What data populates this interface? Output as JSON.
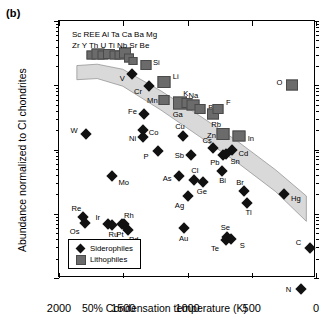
{
  "figure": {
    "panel_label": "(b)",
    "xtitle": "50% Condensation temperature (K)",
    "ytitle": "Abundance normalized to CI chondrites",
    "group_text_line1": "Sc REE Al Ta Ca Ba Mg",
    "group_text_line2": "Zr Y Th U Ti Nb Sr Be"
  },
  "legend": {
    "siderophiles_label": "Siderophiles",
    "lithophiles_label": "Lithophiles"
  },
  "colors": {
    "siderophile": "#111111",
    "lithophile": "#6b6b6b",
    "band": "#d9d9d9",
    "axis": "#000000"
  },
  "chart_data": {
    "type": "scatter",
    "title": "",
    "xlabel": "50% Condensation temperature (K)",
    "ylabel": "Abundance normalized to CI chondrites",
    "xlim": [
      2000,
      0
    ],
    "ylim": [
      0.001,
      10
    ],
    "xscale": "linear",
    "yscale": "log",
    "x_reversed": true,
    "xticks": [
      2000,
      1500,
      1000,
      500,
      0
    ],
    "xticklabels": [
      "2000",
      "1500",
      "1000",
      "500",
      "0"
    ],
    "yticks": [
      10,
      1,
      0.1,
      0.01,
      0.001
    ],
    "yticklabels": [
      "10",
      "1",
      "0.1",
      "0.01",
      "0.001"
    ],
    "grid": false,
    "legend_position": "lower left",
    "annotations": [
      {
        "text": "Sc REE Al Ta Ca Ba Mg",
        "x": 1830,
        "y": 6.2
      },
      {
        "text": "Zr Y Th U Ti Nb Sr Be",
        "x": 1830,
        "y": 4.9
      }
    ],
    "band": {
      "name": "refractory-to-volatile depletion trend band",
      "fill": "#d9d9d9",
      "upper": [
        [
          1860,
          2.0
        ],
        [
          1700,
          2.1
        ],
        [
          1500,
          1.75
        ],
        [
          1200,
          0.8
        ],
        [
          900,
          0.33
        ],
        [
          600,
          0.13
        ],
        [
          300,
          0.046
        ],
        [
          60,
          0.018
        ]
      ],
      "lower": [
        [
          1860,
          1.2
        ],
        [
          1700,
          1.25
        ],
        [
          1500,
          0.95
        ],
        [
          1200,
          0.4
        ],
        [
          900,
          0.155
        ],
        [
          600,
          0.06
        ],
        [
          300,
          0.021
        ],
        [
          60,
          0.0072
        ]
      ]
    },
    "series": [
      {
        "name": "Siderophiles",
        "marker": "diamond",
        "color": "#111111",
        "points": [
          {
            "label": "V",
            "x": 1430,
            "y": 1.5,
            "lx": -10,
            "ly": 4
          },
          {
            "label": "Cr",
            "x": 1300,
            "y": 0.98,
            "lx": -11,
            "ly": 5
          },
          {
            "label": "Fe",
            "x": 1335,
            "y": 0.36,
            "lx": -12,
            "ly": -3
          },
          {
            "label": "Ni",
            "x": 1350,
            "y": 0.2,
            "lx": -10,
            "ly": 8
          },
          {
            "label": "Co",
            "x": 1350,
            "y": 0.155,
            "lx": 11,
            "ly": -5
          },
          {
            "label": "W",
            "x": 1790,
            "y": 0.175,
            "lx": -12,
            "ly": -4
          },
          {
            "label": "Mo",
            "x": 1590,
            "y": 0.038,
            "lx": 12,
            "ly": 6
          },
          {
            "label": "Cu",
            "x": 1035,
            "y": 0.16,
            "lx": -3,
            "ly": -10
          },
          {
            "label": "P",
            "x": 1230,
            "y": 0.095,
            "lx": -12,
            "ly": 5
          },
          {
            "label": "Sb",
            "x": 970,
            "y": 0.082,
            "lx": -12,
            "ly": 0
          },
          {
            "label": "As",
            "x": 1065,
            "y": 0.038,
            "lx": -12,
            "ly": 2
          },
          {
            "label": "Cl",
            "x": 950,
            "y": 0.034,
            "lx": 1,
            "ly": -10
          },
          {
            "label": "Ge",
            "x": 880,
            "y": 0.031,
            "lx": -1,
            "ly": 9
          },
          {
            "label": "Ag",
            "x": 1000,
            "y": 0.019,
            "lx": -8,
            "ly": 9
          },
          {
            "label": "Cs",
            "x": 800,
            "y": 0.105,
            "lx": -6,
            "ly": -8
          },
          {
            "label": "Pb",
            "x": 725,
            "y": 0.082,
            "lx": -8,
            "ly": 7
          },
          {
            "label": "Sn",
            "x": 700,
            "y": 0.086,
            "lx": 9,
            "ly": 7
          },
          {
            "label": "Cd",
            "x": 650,
            "y": 0.098,
            "lx": 11,
            "ly": 3
          },
          {
            "label": "Bi",
            "x": 735,
            "y": 0.046,
            "lx": 1,
            "ly": 9
          },
          {
            "label": "Br",
            "x": 560,
            "y": 0.023,
            "lx": -4,
            "ly": -9
          },
          {
            "label": "Tl",
            "x": 540,
            "y": 0.0145,
            "lx": 2,
            "ly": 9
          },
          {
            "label": "Hg",
            "x": 250,
            "y": 0.0205,
            "lx": 12,
            "ly": 4
          },
          {
            "label": "Re",
            "x": 1810,
            "y": 0.009,
            "lx": -7,
            "ly": -9
          },
          {
            "label": "Os",
            "x": 1800,
            "y": 0.0072,
            "lx": -10,
            "ly": 8
          },
          {
            "label": "Ir",
            "x": 1620,
            "y": 0.007,
            "lx": -10,
            "ly": -7
          },
          {
            "label": "Ru",
            "x": 1585,
            "y": 0.0068,
            "lx": 1,
            "ly": 9
          },
          {
            "label": "Pt",
            "x": 1510,
            "y": 0.007,
            "lx": -2,
            "ly": 10
          },
          {
            "label": "Rh",
            "x": 1495,
            "y": 0.007,
            "lx": 5,
            "ly": -9
          },
          {
            "label": "Pd",
            "x": 1465,
            "y": 0.0056,
            "lx": 6,
            "ly": 9
          },
          {
            "label": "Au",
            "x": 1030,
            "y": 0.006,
            "lx": 0,
            "ly": 10
          },
          {
            "label": "Se",
            "x": 690,
            "y": 0.0044,
            "lx": -2,
            "ly": -10
          },
          {
            "label": "Te",
            "x": 700,
            "y": 0.0039,
            "lx": -11,
            "ly": 8
          },
          {
            "label": "S",
            "x": 660,
            "y": 0.004,
            "lx": 11,
            "ly": 6
          },
          {
            "label": "C",
            "x": 50,
            "y": 0.0029,
            "lx": -11,
            "ly": -6
          },
          {
            "label": "N",
            "x": 120,
            "y": 0.00068,
            "lx": -12,
            "ly": 0
          }
        ]
      },
      {
        "name": "Lithophiles",
        "marker": "square",
        "color": "#6b6b6b",
        "points": [
          {
            "label": "",
            "x": 1748,
            "y": 2.95,
            "w": 7,
            "h": 7
          },
          {
            "label": "",
            "x": 1700,
            "y": 3.1,
            "w": 11,
            "h": 9
          },
          {
            "label": "",
            "x": 1655,
            "y": 2.95,
            "w": 9,
            "h": 7
          },
          {
            "label": "",
            "x": 1610,
            "y": 3.05,
            "w": 10,
            "h": 8
          },
          {
            "label": "",
            "x": 1568,
            "y": 2.95,
            "w": 9,
            "h": 7
          },
          {
            "label": "",
            "x": 1528,
            "y": 3.0,
            "w": 9,
            "h": 7
          },
          {
            "label": "",
            "x": 1487,
            "y": 3.15,
            "w": 10,
            "h": 9
          },
          {
            "label": "",
            "x": 1452,
            "y": 2.7,
            "w": 8,
            "h": 7
          },
          {
            "label": "",
            "x": 1425,
            "y": 2.35,
            "w": 7,
            "h": 6
          },
          {
            "label": "Si",
            "x": 1320,
            "y": 2.05,
            "w": 9,
            "h": 8,
            "lx": 10,
            "ly": -3
          },
          {
            "label": "Li",
            "x": 1185,
            "y": 1.12,
            "w": 11,
            "h": 10,
            "lx": 12,
            "ly": -6
          },
          {
            "label": "Mn",
            "x": 1180,
            "y": 0.6,
            "w": 9,
            "h": 8,
            "lx": -12,
            "ly": 0
          },
          {
            "label": "Ga",
            "x": 1060,
            "y": 0.52,
            "w": 12,
            "h": 11,
            "lx": -2,
            "ly": 11
          },
          {
            "label": "K",
            "x": 1005,
            "y": 0.52,
            "w": 9,
            "h": 8,
            "lx": -1,
            "ly": -10
          },
          {
            "label": "Na",
            "x": 955,
            "y": 0.5,
            "w": 11,
            "h": 9,
            "lx": 0,
            "ly": -10
          },
          {
            "label": "B",
            "x": 905,
            "y": 0.42,
            "w": 9,
            "h": 8,
            "lx": 11,
            "ly": -2
          },
          {
            "label": "Rb",
            "x": 800,
            "y": 0.36,
            "w": 10,
            "h": 9,
            "lx": 3,
            "ly": 10
          },
          {
            "label": "F",
            "x": 760,
            "y": 0.42,
            "w": 9,
            "h": 8,
            "lx": 10,
            "ly": -7
          },
          {
            "label": "Zn",
            "x": 720,
            "y": 0.175,
            "w": 11,
            "h": 10,
            "lx": -12,
            "ly": 1
          },
          {
            "label": "In",
            "x": 600,
            "y": 0.165,
            "w": 11,
            "h": 9,
            "lx": 12,
            "ly": 2
          },
          {
            "label": "O",
            "x": 190,
            "y": 1.0,
            "w": 10,
            "h": 9,
            "lx": -12,
            "ly": -3
          }
        ]
      }
    ]
  }
}
